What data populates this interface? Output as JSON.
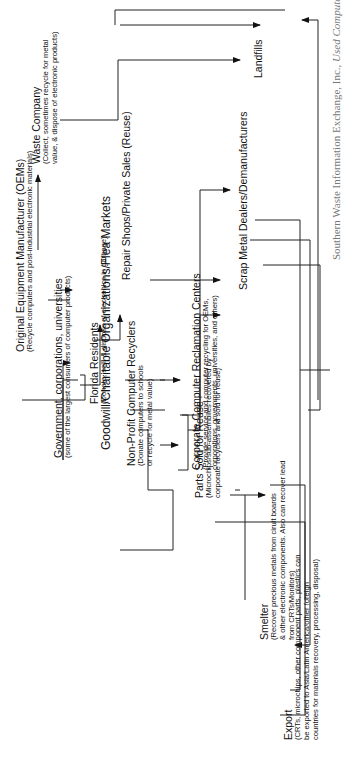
{
  "diagram": {
    "nodes": {
      "oems": {
        "title": "Original Equipment Manufacturer (OEMs)",
        "sub": "(Recycle computers and post-industrial electronic materials)"
      },
      "government": {
        "title": "Government, corporations, universities",
        "sub": "(some of the largest consumers of computer products)"
      },
      "florida": {
        "title": "Florida Residents",
        "sub": "(Donate, sell, & dispose of electronics in garbage)"
      },
      "waste": {
        "title": "Waste Company",
        "sub1": "(Collect, sometimes recycle for metal",
        "sub2": "value, & dispose of electronic products)"
      },
      "goodwill": {
        "title": "Goodwill/Charitable Organizations/Flea Markets"
      },
      "repair": {
        "title": "Repair Shops/Private Sales (Reuse)"
      },
      "nonprofit": {
        "title": "Non-Profit Computer Recyclers",
        "sub1": "(Donate computers to schools",
        "sub2": "or recycle for metal value)"
      },
      "corporate": {
        "title": "Corporate Computer Reclamation Centers",
        "sub1": "(Provide service and computer recycling for OEMs,",
        "sub2": "corporations, governments, universities, and others)"
      },
      "scrap": {
        "title": "Scrap Metal Dealers/Demanufacturers"
      },
      "landfills": {
        "title": "Landfills"
      },
      "parts": {
        "title": "Parts Sold for Reuse",
        "sub1": "(Microchips/sub-assemblies recovered by",
        "sub2": "corporate recyclers and sold for reuse)"
      },
      "smelter": {
        "title": "Smelter",
        "sub1": "(Recover precious metals from cirult boards",
        "sub2": "& other electronic components. Also can recover lead",
        "sub3": "from CRTs/Monitors)"
      },
      "export": {
        "title": "Export",
        "sub1": "(CRTs, microchips, other component parts, plastics can",
        "sub2": "be exported to Asia/Latin America/other foreign",
        "sub3": "countries for materials recovery, processing, disposal)"
      }
    },
    "caption": {
      "text": "Southern Waste Information Exchange, Inc., ",
      "italic": "Used Computer"
    }
  }
}
